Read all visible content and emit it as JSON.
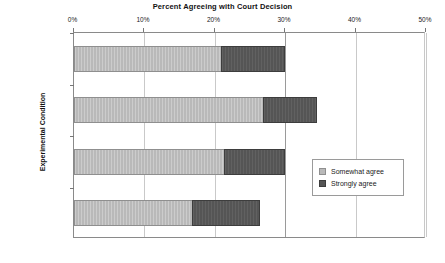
{
  "chart_data": {
    "type": "bar",
    "orientation": "horizontal",
    "stacked": true,
    "title": "Percent Agreeing with Court Decision",
    "xlabel": "",
    "ylabel": "Experimental Condition",
    "categories": [
      "Full Sample",
      "No Add. Text",
      "$266 Million",
      "7% of Total"
    ],
    "series": [
      {
        "name": "Somewhat agree",
        "color": "#b9b9b9",
        "values": [
          21.0,
          27.0,
          21.5,
          17.0
        ]
      },
      {
        "name": "Strongly agree",
        "color": "#555555",
        "values": [
          9.0,
          7.5,
          8.5,
          9.5
        ]
      }
    ],
    "totals": [
      30.0,
      34.5,
      30.0,
      26.5
    ],
    "xlim": [
      0,
      50
    ],
    "xticks": [
      0,
      10,
      20,
      30,
      40,
      50
    ],
    "xtick_labels": [
      "0%",
      "10%",
      "20%",
      "30%",
      "40%",
      "50%"
    ],
    "grid": true,
    "legend_position": "right-middle"
  },
  "legend": {
    "entries": [
      {
        "label": "Somewhat agree",
        "swatch": "somewhat-agree-swatch"
      },
      {
        "label": "Strongly agree",
        "swatch": "strongly-agree-swatch"
      }
    ]
  },
  "axes": {
    "y_title": "Experimental Condition",
    "x_tick_labels": [
      "0%",
      "10%",
      "20%",
      "30%",
      "40%",
      "50%"
    ],
    "y_tick_labels": [
      "Full Sample",
      "No Add. Text",
      "$266 Million",
      "7% of Total"
    ]
  }
}
